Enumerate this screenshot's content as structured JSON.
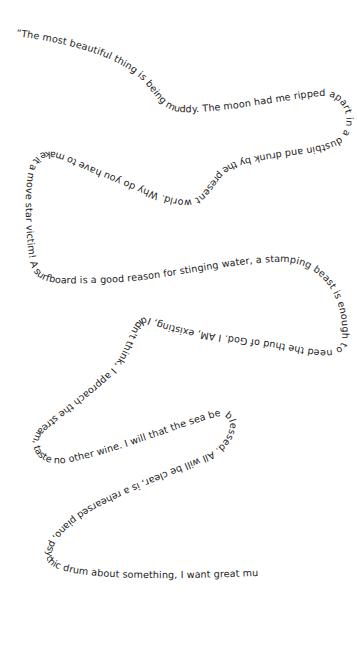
{
  "poem": {
    "text": "“The most beautiful thing is being muddy. The moon had me ripped apart in a dustbin and drunk by the present world. Why do you have to make it a move star victim! A surfboard is a good reason for stinging water, a stamping beast is enough to need the thud of God. I AM, existing, I didn't think, I approach the stream, taste no other wine. I will that the sea be blessed. All will be clear, is a rehearsed piano, psychic drum about something, I want great music, the whole world rattles in my ears.”",
    "path_d": "M 16 36 C 60 42, 110 52, 140 78 C 155 92, 160 110, 180 112 C 220 114, 280 100, 320 96 C 345 94, 352 120, 342 135 C 330 150, 280 148, 240 160 C 215 166, 212 185, 200 195 C 185 210, 140 185, 100 170 C 70 158, 45 140, 32 162 C 22 180, 26 240, 30 262 C 36 288, 60 283, 100 283 C 160 282, 230 262, 280 262 C 325 262, 345 300, 342 340 C 340 360, 300 345, 260 340 C 220 335, 180 330, 150 318 C 130 312, 130 350, 110 370 C 90 390, 60 410, 40 428 C 25 442, 35 470, 70 462 C 120 452, 170 430, 215 417 C 240 410, 232 445, 205 455 C 170 470, 130 485, 100 500 C 70 515, 40 540, 48 562 C 60 580, 150 580, 260 576",
    "color": "#222222"
  }
}
